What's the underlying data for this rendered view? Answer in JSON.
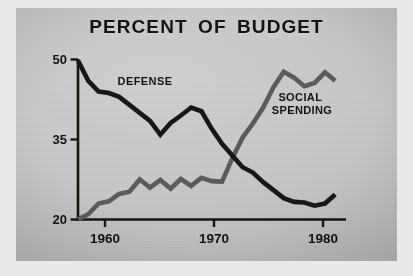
{
  "chart_data": {
    "type": "line",
    "title": "PERCENT OF BUDGET",
    "xlabel": "",
    "ylabel": "",
    "xlim": [
      1957,
      1983
    ],
    "ylim": [
      20,
      50
    ],
    "grid": false,
    "legend_position": "inline-annotations",
    "y_ticks": [
      "50",
      "35",
      "20"
    ],
    "y_tick_values": [
      50,
      35,
      20
    ],
    "x_ticks": [
      "1960",
      "1970",
      "1980"
    ],
    "x_tick_values": [
      1960,
      1970,
      1980
    ],
    "annotations": [
      {
        "name": "defense-label",
        "text": "DEFENSE",
        "x": 1962.3,
        "y": 45.2
      },
      {
        "name": "social-spending-label",
        "text_line1": "SOCIAL",
        "text_line2": "SPENDING",
        "x": 1976.5,
        "y": 42.0
      }
    ],
    "series": [
      {
        "name": "DEFENSE",
        "color": "#171717",
        "x": [
          1957,
          1958,
          1959,
          1960,
          1961,
          1962,
          1963,
          1964,
          1965,
          1966,
          1967,
          1968,
          1969,
          1970,
          1971,
          1972,
          1973,
          1974,
          1975,
          1976,
          1977,
          1978,
          1979,
          1980,
          1981,
          1982
        ],
        "values": [
          49.8,
          46.0,
          44.0,
          43.7,
          43.0,
          41.5,
          40.0,
          38.5,
          35.9,
          38.1,
          39.5,
          41.0,
          40.3,
          37.0,
          34.2,
          32.0,
          29.8,
          28.8,
          27.0,
          25.5,
          24.0,
          23.3,
          23.2,
          22.6,
          23.0,
          24.7
        ]
      },
      {
        "name": "SOCIAL SPENDING",
        "color": "#5c5c5c",
        "x": [
          1957,
          1958,
          1959,
          1960,
          1961,
          1962,
          1963,
          1964,
          1965,
          1966,
          1967,
          1968,
          1969,
          1970,
          1971,
          1972,
          1973,
          1974,
          1975,
          1976,
          1977,
          1978,
          1979,
          1980,
          1981,
          1982
        ],
        "values": [
          20.0,
          21.0,
          23.0,
          23.4,
          24.8,
          25.2,
          27.5,
          26.0,
          27.4,
          25.8,
          27.6,
          26.3,
          27.8,
          27.2,
          27.1,
          31.5,
          35.4,
          38.0,
          41.0,
          44.8,
          47.7,
          46.6,
          45.0,
          45.6,
          47.6,
          46.0
        ]
      }
    ]
  }
}
